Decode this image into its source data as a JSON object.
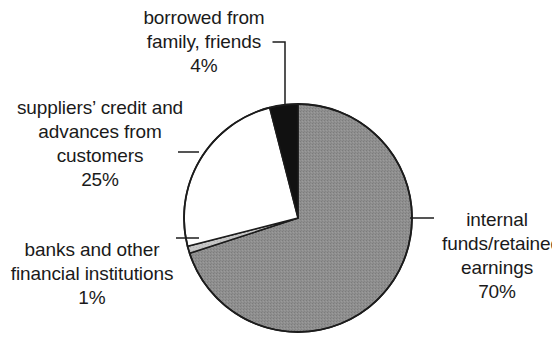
{
  "chart_data": {
    "type": "pie",
    "title": "",
    "xlabel": "",
    "ylabel": "",
    "legend_position": "none",
    "grid": false,
    "labels_outside": true,
    "start_angle_deg": 0,
    "direction": "clockwise",
    "categories": [
      "internal funds/retained earnings",
      "suppliers’ credit and advances from customers",
      "banks and other financial institutions",
      "borrowed from family, friends"
    ],
    "values": [
      70,
      25,
      1,
      4
    ],
    "value_labels": [
      "70%",
      "25%",
      "1%",
      "4%"
    ],
    "unit": "%",
    "colors": [
      "#8a8a8a",
      "#ffffff",
      "#c4c4c4",
      "#111111"
    ],
    "slices": [
      {
        "name": "internal-funds",
        "label_lines": [
          "internal",
          "funds/retained",
          "earnings"
        ],
        "percent_label": "70%",
        "value": 70,
        "color": "#8a8a8a",
        "stroke": "#1c1c1c"
      },
      {
        "name": "suppliers-credit",
        "label_lines": [
          "suppliers’ credit and",
          "advances from",
          "customers"
        ],
        "percent_label": "25%",
        "value": 25,
        "color": "#ffffff",
        "stroke": "#1c1c1c"
      },
      {
        "name": "banks-financial-institutions",
        "label_lines": [
          "banks and other",
          "financial institutions"
        ],
        "percent_label": "1%",
        "value": 1,
        "color": "#c4c4c4",
        "stroke": "#1c1c1c"
      },
      {
        "name": "borrowed-family-friends",
        "label_lines": [
          "borrowed from",
          "family, friends"
        ],
        "percent_label": "4%",
        "value": 4,
        "color": "#111111",
        "stroke": "#1c1c1c"
      }
    ]
  },
  "labels": {
    "borrowed": {
      "line1": "borrowed from",
      "line2": "family, friends",
      "line3": "4%"
    },
    "suppliers": {
      "line1": "suppliers’ credit and",
      "line2": "advances from",
      "line3": "customers",
      "line4": "25%"
    },
    "banks": {
      "line1": "banks and other",
      "line2": "financial institutions",
      "line3": "1%"
    },
    "internal": {
      "line1": "internal",
      "line2": "funds/retained",
      "line3": "earnings",
      "line4": "70%"
    }
  }
}
